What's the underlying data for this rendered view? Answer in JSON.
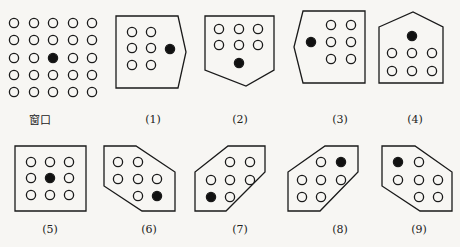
{
  "diagram": {
    "colors": {
      "stroke": "#1a1a1a",
      "background": "#f7f6f3",
      "filled_dot": "#111111"
    },
    "window": {
      "label": "窗口",
      "label_pos": [
        40,
        119
      ],
      "grid_size": 5,
      "xs": [
        14,
        34,
        53,
        73,
        92
      ],
      "ys": [
        23,
        40,
        58,
        75,
        92
      ],
      "filled": [
        2,
        2
      ]
    },
    "templates": [
      {
        "label": "(1)",
        "label_pos": [
          153,
          119
        ],
        "outline": [
          [
            116,
            16
          ],
          [
            178,
            16
          ],
          [
            186,
            52
          ],
          [
            178,
            88
          ],
          [
            116,
            88
          ]
        ],
        "open": [
          [
            132,
            32
          ],
          [
            151,
            32
          ],
          [
            132,
            48
          ],
          [
            151,
            48
          ],
          [
            132,
            65
          ],
          [
            151,
            65
          ]
        ],
        "filled": [
          [
            170,
            49
          ]
        ]
      },
      {
        "label": "(2)",
        "label_pos": [
          240,
          119
        ],
        "outline": [
          [
            205,
            16
          ],
          [
            274,
            16
          ],
          [
            274,
            70
          ],
          [
            246,
            86
          ],
          [
            205,
            70
          ]
        ],
        "open": [
          [
            219,
            29
          ],
          [
            239,
            29
          ],
          [
            258,
            29
          ],
          [
            219,
            45
          ],
          [
            239,
            45
          ],
          [
            258,
            45
          ]
        ],
        "filled": [
          [
            239,
            63
          ]
        ]
      },
      {
        "label": "(3)",
        "label_pos": [
          340,
          119
        ],
        "outline": [
          [
            303,
            11
          ],
          [
            365,
            11
          ],
          [
            365,
            83
          ],
          [
            303,
            83
          ],
          [
            294,
            47
          ]
        ],
        "open": [
          [
            331,
            25
          ],
          [
            351,
            25
          ],
          [
            331,
            42
          ],
          [
            351,
            42
          ],
          [
            331,
            59
          ],
          [
            351,
            59
          ]
        ],
        "filled": [
          [
            311,
            42
          ]
        ]
      },
      {
        "label": "(4)",
        "label_pos": [
          415,
          119
        ],
        "outline": [
          [
            379,
            27
          ],
          [
            413,
            12
          ],
          [
            443,
            27
          ],
          [
            443,
            83
          ],
          [
            379,
            83
          ]
        ],
        "open": [
          [
            392,
            53
          ],
          [
            412,
            53
          ],
          [
            432,
            53
          ],
          [
            392,
            71
          ],
          [
            412,
            71
          ],
          [
            432,
            71
          ]
        ],
        "filled": [
          [
            412,
            36
          ]
        ]
      },
      {
        "label": "(5)",
        "label_pos": [
          50,
          229
        ],
        "outline": [
          [
            15,
            146
          ],
          [
            86,
            146
          ],
          [
            86,
            211
          ],
          [
            15,
            211
          ]
        ],
        "open": [
          [
            31,
            162
          ],
          [
            50,
            162
          ],
          [
            69,
            162
          ],
          [
            31,
            178
          ],
          [
            69,
            178
          ],
          [
            31,
            195
          ],
          [
            50,
            195
          ],
          [
            69,
            195
          ]
        ],
        "filled": [
          [
            50,
            178
          ]
        ]
      },
      {
        "label": "(6)",
        "label_pos": [
          149,
          229
        ],
        "outline": [
          [
            104,
            146
          ],
          [
            136,
            146
          ],
          [
            175,
            172
          ],
          [
            175,
            211
          ],
          [
            142,
            211
          ],
          [
            104,
            186
          ]
        ],
        "open": [
          [
            118,
            162
          ],
          [
            138,
            162
          ],
          [
            118,
            179
          ],
          [
            138,
            179
          ],
          [
            157,
            179
          ],
          [
            138,
            196
          ]
        ],
        "filled": [
          [
            157,
            196
          ]
        ]
      },
      {
        "label": "(7)",
        "label_pos": [
          240,
          229
        ],
        "outline": [
          [
            228,
            146
          ],
          [
            265,
            146
          ],
          [
            265,
            172
          ],
          [
            226,
            211
          ],
          [
            195,
            211
          ],
          [
            195,
            172
          ]
        ],
        "open": [
          [
            230,
            162
          ],
          [
            250,
            162
          ],
          [
            211,
            180
          ],
          [
            230,
            180
          ],
          [
            250,
            180
          ],
          [
            230,
            197
          ]
        ],
        "filled": [
          [
            211,
            197
          ]
        ]
      },
      {
        "label": "(8)",
        "label_pos": [
          340,
          229
        ],
        "outline": [
          [
            325,
            146
          ],
          [
            358,
            146
          ],
          [
            358,
            172
          ],
          [
            320,
            211
          ],
          [
            288,
            211
          ],
          [
            288,
            172
          ]
        ],
        "open": [
          [
            321,
            162
          ],
          [
            302,
            180
          ],
          [
            321,
            180
          ],
          [
            341,
            180
          ],
          [
            302,
            197
          ],
          [
            321,
            197
          ]
        ],
        "filled": [
          [
            341,
            162
          ]
        ]
      },
      {
        "label": "(9)",
        "label_pos": [
          419,
          229
        ],
        "outline": [
          [
            382,
            146
          ],
          [
            415,
            146
          ],
          [
            452,
            172
          ],
          [
            452,
            211
          ],
          [
            420,
            211
          ],
          [
            382,
            186
          ]
        ],
        "open": [
          [
            419,
            162
          ],
          [
            398,
            180
          ],
          [
            419,
            180
          ],
          [
            438,
            180
          ],
          [
            419,
            197
          ],
          [
            438,
            197
          ]
        ],
        "filled": [
          [
            398,
            162
          ]
        ]
      }
    ]
  }
}
